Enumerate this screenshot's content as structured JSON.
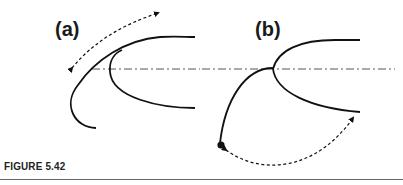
{
  "figure": {
    "panels": [
      {
        "label": "(a)"
      },
      {
        "label": "(b)"
      }
    ],
    "caption": "FIGURE 5.42",
    "colors": {
      "stroke": "#111111",
      "axis": "#555555",
      "rule": "#666666"
    }
  }
}
